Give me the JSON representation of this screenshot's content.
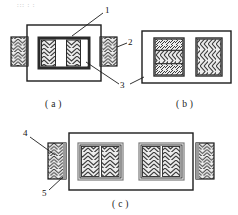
{
  "figure": {
    "title_artifact": "::: : :",
    "captions": [
      {
        "id": "caption-a",
        "text": "( a )"
      },
      {
        "id": "caption-b",
        "text": "( b )"
      },
      {
        "id": "caption-c",
        "text": "( c )"
      }
    ],
    "callouts": [
      {
        "id": "callout-1",
        "text": "1"
      },
      {
        "id": "callout-2",
        "text": "2"
      },
      {
        "id": "callout-3",
        "text": "3"
      },
      {
        "id": "callout-4",
        "text": "4"
      },
      {
        "id": "callout-5",
        "text": "5"
      }
    ],
    "colors": {
      "line": "#1c1c1c",
      "hatch": "#3a3a3a",
      "fill_light": "#e8e8e8",
      "fill_white": "#ffffff",
      "background": "#ffffff",
      "smudge": "#b9b9b9"
    },
    "panels": [
      {
        "id": "panel-a",
        "caption": "( a )",
        "description": "Outer frame with central core of two chevron-hatched bars and a blank middle gap, flanked by two external hatched tabs",
        "elements": [
          "outer-frame",
          "core-block",
          "core-bar-left",
          "core-gap",
          "core-bar-right",
          "tab-left",
          "tab-right"
        ]
      },
      {
        "id": "panel-b",
        "caption": "( b )",
        "description": "Outer frame containing two hatched blocks; left block split into three horizontal bands, right block uniform chevron",
        "elements": [
          "outer-frame",
          "block-left",
          "block-right"
        ]
      },
      {
        "id": "panel-c",
        "caption": "( c )",
        "description": "Wide outer frame enclosing two framed groups, each with two vertical chevron bars; external hatched tabs at both sides",
        "elements": [
          "outer-frame",
          "group-left",
          "group-right",
          "tab-left",
          "tab-right"
        ]
      }
    ]
  }
}
